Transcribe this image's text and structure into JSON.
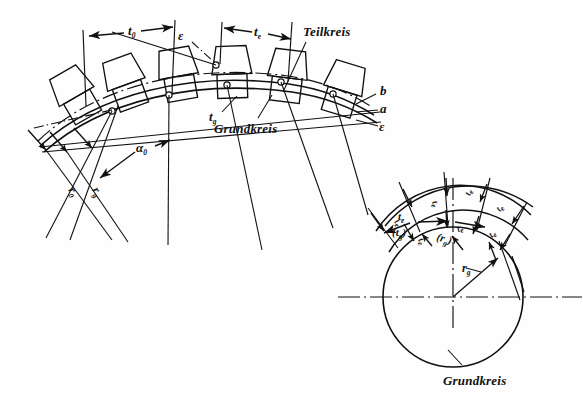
{
  "figure": {
    "type": "technical-diagram",
    "language": "de",
    "background_color": "#fefefe",
    "ink_color": "#111111"
  },
  "left_diagram": {
    "name": "gear-rack-arc",
    "description": "Curved gear tooth strip with pitch circle and base circle construction lines",
    "labels": {
      "pitch_circle": "Teilkreis",
      "base_circle": "Grundkreis",
      "pitch_t0": "t",
      "pitch_t0_sub": "0",
      "pitch_te": "t",
      "pitch_te_sub": "e",
      "pitch_tg": "t",
      "pitch_tg_sub": "g",
      "angle_alpha0": "α",
      "angle_alpha0_sub": "0",
      "radius_r0": "r",
      "radius_r0_sub": "0",
      "radius_rg": "r",
      "radius_rg_sub": "g",
      "epsilon_top": "ε",
      "epsilon_right": "ε",
      "line_b": "b",
      "line_a": "a"
    }
  },
  "right_diagram": {
    "name": "base-circle-involute",
    "description": "Base circle with radiating involute normals and pitch arcs",
    "labels": {
      "base_circle": "Grundkreis",
      "radius_rg": "r",
      "radius_rg_sub": "g",
      "pitch_te": "t",
      "pitch_te_sub": "e",
      "pitch_tg_paren": "(t",
      "pitch_tg_paren_sub": "g",
      "pitch_tg_paren_close": ")",
      "radius_rg_paren": "(r",
      "radius_rg_paren_sub": "g",
      "radius_rg_paren_close": ")",
      "repeat_te": "t",
      "repeat_te_sub": "e"
    },
    "arc_count": 3,
    "radial_count": 5
  }
}
